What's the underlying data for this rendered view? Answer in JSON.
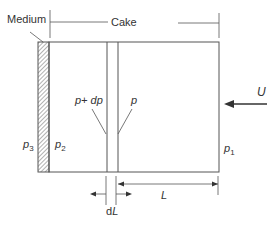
{
  "diagram": {
    "labels": {
      "medium": "Medium",
      "cake": "Cake",
      "p_plus_dp": "p+ dp",
      "p": "p",
      "p3": "p3",
      "p2": "p2",
      "p1": "p1",
      "U": "U",
      "dL": "dL",
      "L": "L"
    },
    "colors": {
      "line": "#555555",
      "text": "#333333",
      "background": "#ffffff"
    }
  }
}
